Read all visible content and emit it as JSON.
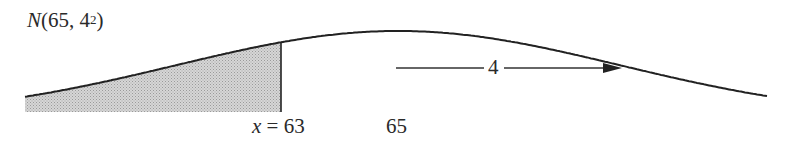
{
  "diagram": {
    "title": {
      "prefix": "N",
      "open": "(65, 4",
      "exponent": "2",
      "close": ")"
    },
    "distribution": {
      "type": "normal",
      "mean": 65,
      "sd": 4,
      "variance_label": "4²"
    },
    "shaded_region": {
      "description": "area to the left of x = 63",
      "upper_bound": 63
    },
    "labels": {
      "x_var": "x",
      "x_equals": " = 63",
      "mean_tick": "65",
      "sd_arrow": "4"
    },
    "colors": {
      "curve": "#222222",
      "shade": "#c8c8c8",
      "text": "#2a2a2a"
    }
  }
}
